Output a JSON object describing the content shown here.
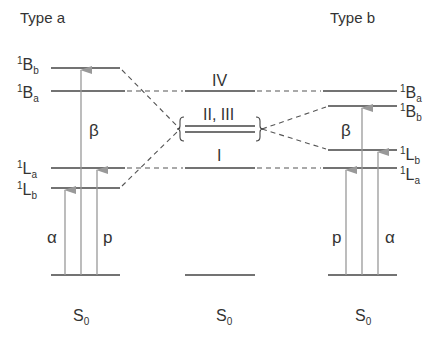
{
  "titles": {
    "left": "Type a",
    "right": "Type b"
  },
  "left": {
    "levels": [
      {
        "sup": "1",
        "main": "B",
        "sub": "b"
      },
      {
        "sup": "1",
        "main": "B",
        "sub": "a"
      },
      {
        "sup": "1",
        "main": "L",
        "sub": "a"
      },
      {
        "sup": "1",
        "main": "L",
        "sub": "b"
      }
    ],
    "transitions": {
      "alpha": "α",
      "beta": "β",
      "p": "p"
    },
    "ground": {
      "main": "S",
      "sub": "0"
    }
  },
  "center": {
    "levels": {
      "iv": "IV",
      "ii_iii": "II, III",
      "i": "I"
    },
    "ground": {
      "main": "S",
      "sub": "0"
    }
  },
  "right": {
    "levels": [
      {
        "sup": "1",
        "main": "B",
        "sub": "a"
      },
      {
        "sup": "1",
        "main": "B",
        "sub": "b"
      },
      {
        "sup": "1",
        "main": "L",
        "sub": "b"
      },
      {
        "sup": "1",
        "main": "L",
        "sub": "a"
      }
    ],
    "transitions": {
      "alpha": "α",
      "beta": "β",
      "p": "p"
    },
    "ground": {
      "main": "S",
      "sub": "0"
    }
  },
  "colors": {
    "line": "#444444",
    "arrow": "#999999",
    "dash": "#555555"
  }
}
